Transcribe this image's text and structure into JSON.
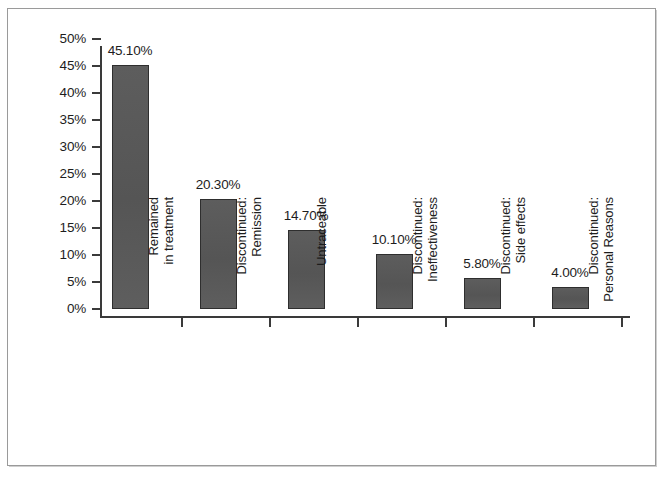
{
  "chart_data": {
    "type": "bar",
    "title": "",
    "subtitle": "",
    "xlabel": "",
    "ylabel": "",
    "ylim": [
      0,
      50
    ],
    "ytick_values": [
      0,
      5,
      10,
      15,
      20,
      25,
      30,
      35,
      40,
      45,
      50
    ],
    "ytick_labels": [
      "0%",
      "5%",
      "10%",
      "15%",
      "20%",
      "25%",
      "30%",
      "35%",
      "40%",
      "45%",
      "50%"
    ],
    "grid": false,
    "legend": false,
    "legend_position": "none",
    "value_label_format": "percent-2dp",
    "categories": [
      "Remained in treatment",
      "Discontinued: Remission",
      "Untraceable",
      "Discontinued: Ineffectiveness",
      "Discontinued: Side effects",
      "Discontinued: Personal Reasons"
    ],
    "category_lines": [
      [
        "Remained",
        "in treatment"
      ],
      [
        "Discontinued:",
        "Remission"
      ],
      [
        "Untraceable"
      ],
      [
        "Discontinued:",
        "Ineffectiveness"
      ],
      [
        "Discontinued:",
        "Side effects"
      ],
      [
        "Discontinued:",
        "Personal Reasons"
      ]
    ],
    "values": [
      45.1,
      20.3,
      14.7,
      10.1,
      5.8,
      4.0
    ],
    "value_labels": [
      "45.10%",
      "20.30%",
      "14.70%",
      "10.10%",
      "5.80%",
      "4.00%"
    ],
    "colors": {
      "bar_fill": "#595959",
      "bar_edge": "#2e2e2e",
      "axis": "#3a3a3a",
      "text": "#1d1d1d",
      "background": "#ffffff",
      "frame": "#9a9a9a"
    }
  }
}
